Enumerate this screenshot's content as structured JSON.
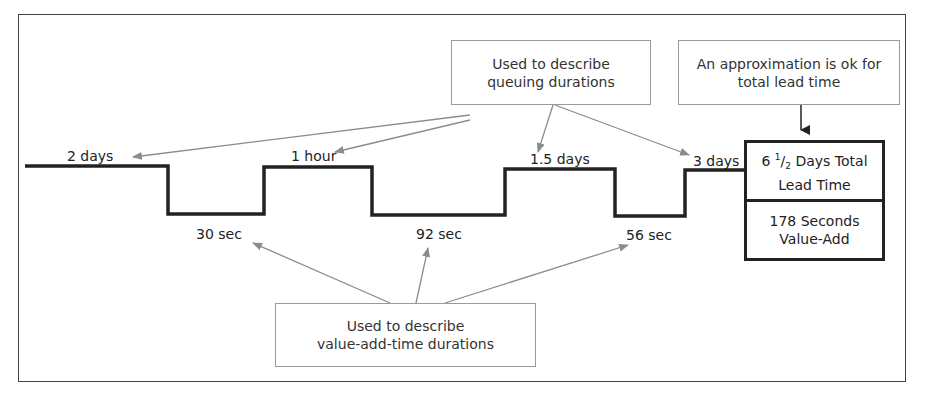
{
  "diagram": {
    "type": "value-stream timeline",
    "callouts": {
      "queue": {
        "line1": "Used to describe",
        "line2": "queuing durations"
      },
      "approx": {
        "line1": "An approximation is ok for",
        "line2": "total lead time"
      },
      "value_add": {
        "line1": "Used to describe",
        "line2": "value-add-time durations"
      }
    },
    "queue_times": [
      "2 days",
      "1 hour",
      "1.5 days",
      "3 days"
    ],
    "value_add_times": [
      "30 sec",
      "92 sec",
      "56 sec"
    ],
    "summary": {
      "lead_time": {
        "prefix": "6 ",
        "num": "1",
        "slash": "/",
        "den": "2",
        "suffix": " Days Total",
        "line2": "Lead Time"
      },
      "value_add": {
        "line1": "178 Seconds",
        "line2": "Value-Add"
      }
    },
    "colors": {
      "timeline": "#222222",
      "arrow_gray": "#8c8c8c",
      "callout_border": "#9a9a9a"
    }
  }
}
